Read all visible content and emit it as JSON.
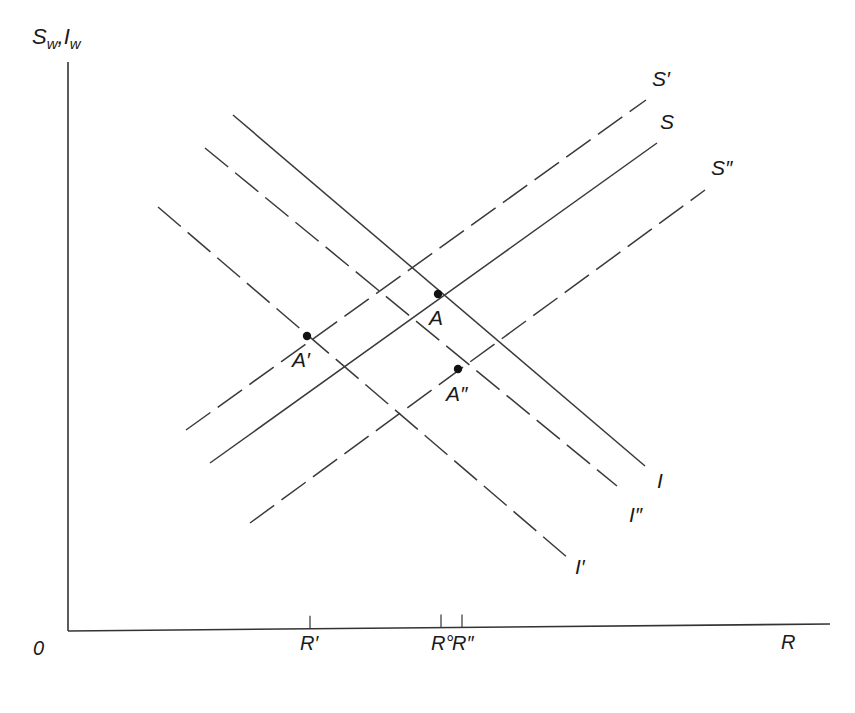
{
  "diagram": {
    "type": "economics-diagram",
    "y_axis_label": "S",
    "y_axis_label_sub1": "w",
    "y_axis_label_sep": ",",
    "y_axis_label2": "I",
    "y_axis_label_sub2": "w",
    "x_axis_label": "R",
    "origin_label": "0",
    "ticks": [
      {
        "label": "R′",
        "x": 310
      },
      {
        "label": "R°",
        "x": 441
      },
      {
        "label": "R″",
        "x": 462
      }
    ],
    "curves": [
      {
        "name": "S′",
        "style": "dashed",
        "x1": 186,
        "y1": 430,
        "x2": 646,
        "y2": 100,
        "label_x": 652,
        "label_y": 86
      },
      {
        "name": "S",
        "style": "solid",
        "x1": 210,
        "y1": 463,
        "x2": 657,
        "y2": 143,
        "label_x": 660,
        "label_y": 129
      },
      {
        "name": "S″",
        "style": "dashed",
        "x1": 250,
        "y1": 523,
        "x2": 705,
        "y2": 190,
        "label_x": 711,
        "label_y": 175
      },
      {
        "name": "I",
        "style": "solid",
        "x1": 233,
        "y1": 115,
        "x2": 645,
        "y2": 466,
        "label_x": 657,
        "label_y": 488
      },
      {
        "name": "I″",
        "style": "dashed",
        "x1": 205,
        "y1": 148,
        "x2": 617,
        "y2": 486,
        "label_x": 629,
        "label_y": 522
      },
      {
        "name": "I′",
        "style": "dashed",
        "x1": 158,
        "y1": 207,
        "x2": 568,
        "y2": 558,
        "label_x": 575,
        "label_y": 574
      }
    ],
    "points": [
      {
        "name": "A",
        "x": 438,
        "y": 294,
        "label_x": 429,
        "label_y": 325
      },
      {
        "name": "A′",
        "x": 307,
        "y": 336,
        "label_x": 292,
        "label_y": 367
      },
      {
        "name": "A″",
        "x": 458,
        "y": 369,
        "label_x": 446,
        "label_y": 401
      }
    ]
  }
}
